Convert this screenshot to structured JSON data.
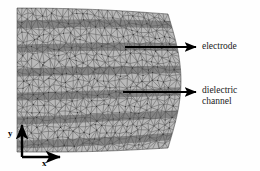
{
  "figure": {
    "type": "mesh-diagram",
    "background_color": "#fefefe",
    "mesh_fill_color": "#b8b8b8",
    "mesh_edge_color": "#4a4a4a",
    "band_color": "#5a5a5a",
    "annotation_color": "#000000"
  },
  "annotations": [
    {
      "id": "electrode",
      "label": "electrode",
      "arrow": {
        "x1": 125,
        "y1": 47,
        "x2": 196,
        "y2": 47
      },
      "text_x": 202,
      "text_y": 41
    },
    {
      "id": "dielectric-channel",
      "label_line1": "dielectric",
      "label_line2": "channel",
      "arrow": {
        "x1": 123,
        "y1": 92,
        "x2": 196,
        "y2": 92
      },
      "text_x": 202,
      "text_y": 85
    }
  ],
  "axes": {
    "origin": {
      "x": 22,
      "y": 157
    },
    "x_axis": {
      "label": "x",
      "length": 38,
      "direction": "right"
    },
    "y_axis": {
      "label": "y",
      "length": 32,
      "direction": "up"
    }
  },
  "mesh_region": {
    "left_edge_x": 17,
    "top_edge_y_left": 8,
    "top_edge_y_right": 14,
    "bottom_edge_y_left": 152,
    "bottom_edge_y_right": 148,
    "right_edge_bulge_x": 181,
    "right_edge_base_x": 168,
    "band_count": 6,
    "band_slope": -0.22
  }
}
